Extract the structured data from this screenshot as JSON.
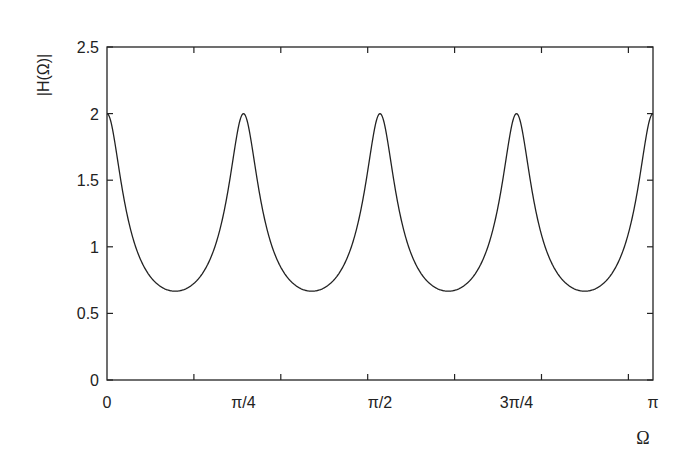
{
  "chart_data": {
    "type": "line",
    "title": "",
    "xlabel": "Ω",
    "ylabel": "|H(Ω)|",
    "xlim": [
      0,
      3.14159
    ],
    "ylim": [
      0,
      2.5
    ],
    "grid": false,
    "legend": null,
    "x_tick_labels": [
      {
        "value": 0,
        "label": "0"
      },
      {
        "value": 0.785398,
        "label": "π/4"
      },
      {
        "value": 1.570796,
        "label": "π/2"
      },
      {
        "value": 2.356194,
        "label": "3π/4"
      },
      {
        "value": 3.141593,
        "label": "π"
      }
    ],
    "x_minor_ticks": [
      0.5,
      1.0,
      1.5,
      2.0,
      2.5,
      3.0
    ],
    "y_ticks": [
      {
        "value": 0,
        "label": "0"
      },
      {
        "value": 0.5,
        "label": "0.5"
      },
      {
        "value": 1,
        "label": "1"
      },
      {
        "value": 1.5,
        "label": "1.5"
      },
      {
        "value": 2,
        "label": "2"
      },
      {
        "value": 2.5,
        "label": "2.5"
      }
    ],
    "series": [
      {
        "name": "|H(Ω)|",
        "color": "#222222",
        "description": "Periodic comb response: peaks of 2 at 0, π/4, π/2, 3π/4, π; minima ≈0.67 at π/8, 3π/8, 5π/8, 7π/8",
        "x": [
          0,
          0.0982,
          0.1963,
          0.2945,
          0.3927,
          0.4909,
          0.589,
          0.6872,
          0.7854,
          0.8836,
          0.9817,
          1.0799,
          1.1781,
          1.2763,
          1.3744,
          1.4726,
          1.5708,
          1.669,
          1.7671,
          1.8653,
          1.9635,
          2.0617,
          2.1598,
          2.258,
          2.3562,
          2.4544,
          2.5525,
          2.6507,
          2.7489,
          2.8471,
          2.9452,
          3.0434,
          3.1416
        ],
        "values": [
          2.0,
          1.08,
          0.8,
          0.7,
          0.67,
          0.7,
          0.8,
          1.08,
          2.0,
          1.08,
          0.8,
          0.7,
          0.67,
          0.7,
          0.8,
          1.08,
          2.0,
          1.08,
          0.8,
          0.7,
          0.67,
          0.7,
          0.8,
          1.08,
          2.0,
          1.08,
          0.8,
          0.7,
          0.67,
          0.7,
          0.8,
          1.08,
          2.0
        ]
      }
    ],
    "model": {
      "N": 8,
      "a": 0.5,
      "peak": 2.0,
      "min": 0.6667
    }
  },
  "plot_area": {
    "left": 107,
    "top": 47,
    "right": 653,
    "bottom": 380
  },
  "style": {
    "line_color": "#222222",
    "axis_color": "#222222",
    "background": "#ffffff"
  }
}
